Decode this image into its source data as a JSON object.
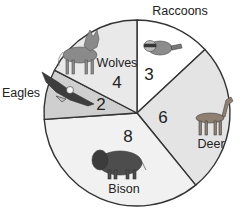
{
  "chart_data": {
    "type": "pie",
    "title": "",
    "categories": [
      "Raccoons",
      "Deer",
      "Bison",
      "Eagles",
      "Wolves"
    ],
    "values": [
      3,
      6,
      8,
      2,
      4
    ],
    "total": 23,
    "slice_colors": [
      "#ffffff",
      "#e4e4e4",
      "#f1f1f1",
      "#cfcfcf",
      "#e9e9e9"
    ],
    "labels": [
      {
        "name": "Raccoons",
        "value": "3",
        "icon": "raccoon-icon"
      },
      {
        "name": "Deer",
        "value": "6",
        "icon": "deer-icon"
      },
      {
        "name": "Bison",
        "value": "8",
        "icon": "bison-icon"
      },
      {
        "name": "Eagles",
        "value": "2",
        "icon": "eagle-icon"
      },
      {
        "name": "Wolves",
        "value": "4",
        "icon": "wolf-icon"
      }
    ],
    "legend": "none",
    "start_angle_deg": 0,
    "direction": "clockwise"
  }
}
